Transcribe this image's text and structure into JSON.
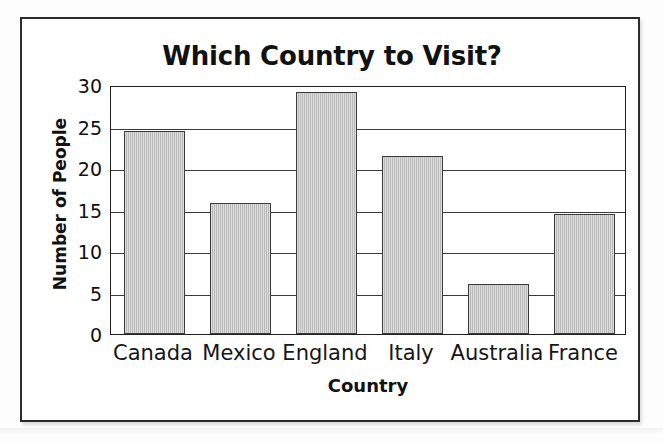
{
  "chart_data": {
    "type": "bar",
    "title": "Which Country to Visit?",
    "xlabel": "Country",
    "ylabel": "Number of People",
    "categories": [
      "Canada",
      "Mexico",
      "England",
      "Italy",
      "Australia",
      "France"
    ],
    "values": [
      24.5,
      15.8,
      29.2,
      21.5,
      6,
      14.5
    ],
    "ylim": [
      0,
      30
    ],
    "yticks": [
      0,
      5,
      10,
      15,
      20,
      25,
      30
    ],
    "ytick_labels": [
      "0",
      "5",
      "10",
      "15",
      "20",
      "25",
      "30"
    ],
    "grid": true,
    "legend": false,
    "bar_fill": "#c3c3c3",
    "bar_border": "#3b3b3b",
    "axis_color": "#1f1f1f",
    "text_color": "#111111",
    "background": "#ffffff"
  }
}
